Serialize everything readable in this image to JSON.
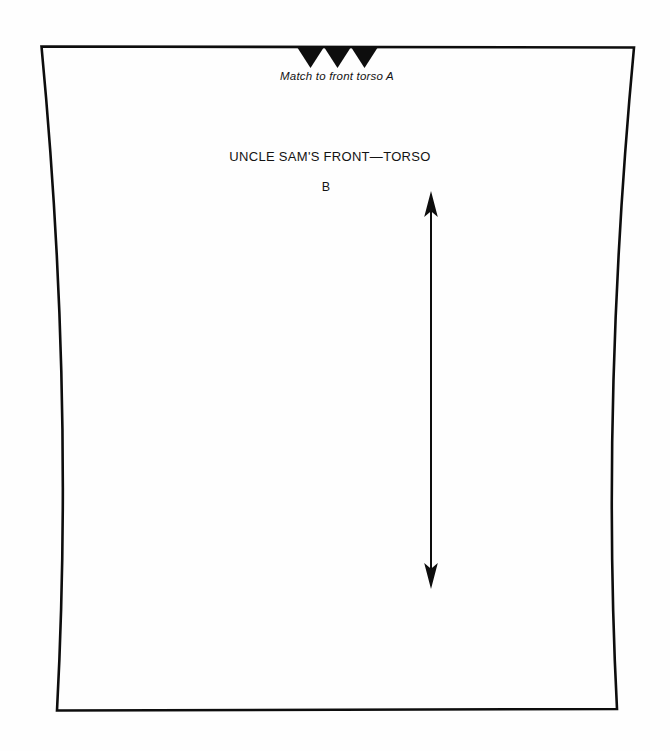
{
  "page": {
    "background_color": "#fefefe",
    "ink_color": "#0d0d0d"
  },
  "pattern": {
    "title": "UNCLE SAM'S FRONT—TORSO",
    "piece_letter": "B",
    "match_note": "Match to front torso A"
  }
}
